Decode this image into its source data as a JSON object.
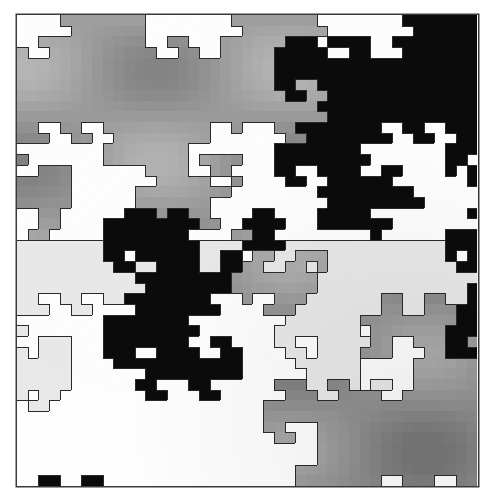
{
  "figure": {
    "grid": {
      "cols": 43,
      "rows": 44,
      "cell_px": 10.71
    },
    "palette": {
      "W": {
        "name": "white",
        "hex": "#fdfdfd"
      },
      "L": {
        "name": "light-gray",
        "hex": "#e8e8e8"
      },
      "M": {
        "name": "mid-gray",
        "hex": "#a3a3a3"
      },
      "K": {
        "name": "black",
        "hex": "#0b0b0b"
      }
    },
    "outline_color": "#2a2a2a",
    "rows": [
      "WWWWMMMMMMMMWWWWWWWWMMMMMMMMWWWWWWWWKKKKKKK",
      "WWWWWMMMMMMMWWWWWWWWWMMMMMMMMWWWWWWWWKKKKKK",
      "WWMMMMMMMMMMWWMMWWWMMMMMMKKKWKKKKWWKKKKKKKK",
      "MWWMMMMMMMMMMWWMMWWMMMMMKKKKKWWKKWWWKKKKKKK",
      "MMMMMMMMMMMMMMMMMMMMMMMMKKKKKKKKKKKKKKKKKKK",
      "MMMMMMMMMMMMMMMMMMMMMMMMKKKKKKKKKKKKKKKKKKK",
      "MMMMMMMMMMMMMMMMMMMMMMMMKKMMKKKKKKKKKKKKKKK",
      "MMMMMMMMMMMMMMMMMMMMMMMMMKKMMKKKKKKKKKKKKKK",
      "MMMMMMMMMMMMMMMMMMMMMMMMMMMMKKKKKKKKKKKKKKK",
      "MMMMMMMMMMMMMMMMMMMMMMMMMMMMMKKKKKKKKKKKKKK",
      "MMWWMMWWMMMMMMMMMMWWMWWWMMKKKKKKKKWWKKWWKKK",
      "MMMWWMMWWMMMMMMMMMWWWWWWWMMKKKKKKKKWWKKWWKK",
      "WWWWWWWWMMMMMMMMWWWWWWWWKKKKKKKKWWWWWWWWKKK",
      "MWWWWWWWMMMMMMMMWMMMMWWWKKKKKKKKKWWWWWWWKKW",
      "WWMMMWWWWWWWMMMMWWMMWWWWKKWWKKKKWWKKWWWWKWK",
      "MMMMMWWWWWWWWMMMMMWWMWWWWKKWWKKKKKKWWWWWWWK",
      "MMMMMWWWWWWMMMMMMMMMWWWWWWWWKKKKKKKKKWWWWWW",
      "MMMMMWWWWWWMMMMMMMWWWWWWWWWWWKKKKKKKKKWWWWW",
      "WWMMWWWWWWKKKMKKMMWWWWKKWWWWKKKKKWWWWWWWWWK",
      "WWMMWWWWKKKKKKKKKMMWWKKKKWWWKKKKKKKWWWWWWWW",
      "WMMWWWWWKKKKKKKKWWWWMMKKWWWWWWWWWKWWWWWWKKK",
      "LLLLLLLLKKKKKKKKKLLLLKKKKLLLLLLLLLLLLLLLKKK",
      "LLLLLLLLKKWKKKKKKLLKKWMMLLMMMLLLLLLLLLLLKWK",
      "LLLLLLLLLKKLLKKKKLLKKMMLLMMLMLLLLLLLLLLLLKK",
      "LLLLLLLLLLLKKKKKKKKKMMMMMMMMLLLLLLLLLLLLLLL",
      "LLLLLLLLLLLLKKKKKKKKMMMMMMMMLLLLLLLLLLLLLLK",
      "LLWWLLWWLLKKKKKKKKWWWMWWMMMLLLLLLLMMLLMMLLK",
      "LLLWWLLWWWWKKKKKKKKWWWWMMMLLLLLLLLMMLLMMMKK",
      "WWWWWWWWKKKKKKKKWWWWWWWWWLLLLLLLMMMMMMMMMKK",
      "LWWWWWWWKKKKKKKKKWWWWWWWLLLLLLLLWMMMMMMMKKK",
      "WWLLLWWWKKKKKKKKWWKKWWWWLLWWLLLLLMMWWMMMKKM",
      "LWLLLWWWKKKWWKKKKWWKKWWWWLLWLLLLMMMWWWMMKKK",
      "LLLLLWWWWKKKKKKKKKKKKWWWWWLLLLLLWWWWWMMMMMM",
      "LLLLLWWWWWWWKKKKKKKKKWWWWWWLLLLLWWWWWMMMMMM",
      "LLLLLWWWWWWKKWWWKKWWWWWWMMMLLMMLWLLWWMMMMMM",
      "LWLLWWWWWWWWKKWWWKKWWWWWWMMMLLMMMMWWMMMMMMM",
      "WLLWWWWWWWWWWWWWWWWWWWWMMMMMMMMMMMMMMMMMMMM",
      "WWWWWWWWWWWWWWWWWWWWWWWMMMMMMMMMMMMMMMMMMMM",
      "WWWWWWWWWWWWWWWWWWWWWWWMMWWWMMMMMMMMMMMMMMM",
      "WWWWWWWWWWWWWWWWWWWWWWWWMMWWMMMMMMMMMMMMMMM",
      "WWWWWWWWWWWWWWWWWWWWWWWWWWWWMMMMMMMMMMMMMMM",
      "WWWWWWWWWWWWWWWWWWWWWWWWWWWWMMMMMMMMMMMMMMM",
      "WWWWWWWWWWWWWWWWWWWWWWWWWWMMMMMMMMMMMMMMMMM",
      "WWKKWWKKWWWWWWWWWWWWWWWWWWMMMMMMMMWWMMMWWMM"
    ]
  }
}
